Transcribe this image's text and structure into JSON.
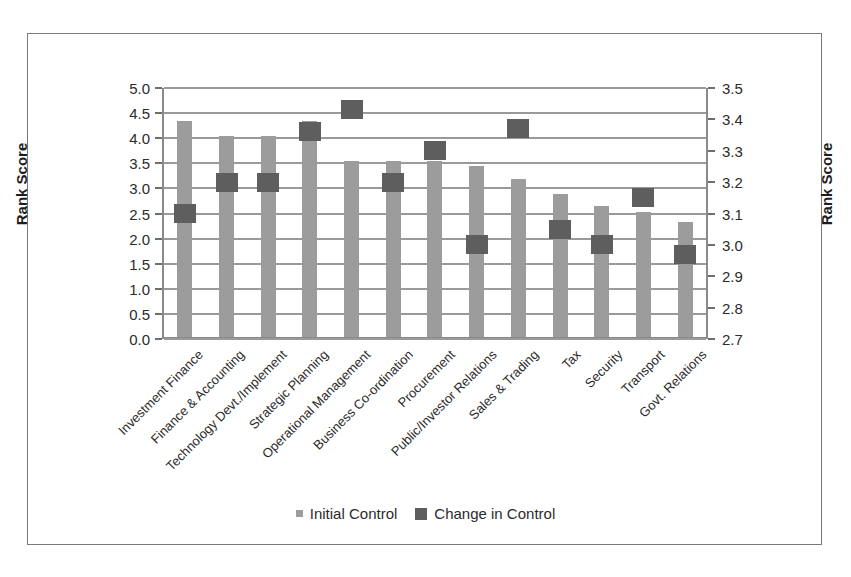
{
  "chart_data": {
    "type": "bar",
    "title": "",
    "categories": [
      "Investment Finance",
      "Finance & Accounting",
      "Technology Devt./Implement",
      "Strategic Planning",
      "Operational Management",
      "Business Co-ordination",
      "Procurement",
      "Public/Investor Relations",
      "Sales & Trading",
      "Tax",
      "Security",
      "Transport",
      "Govt. Relations"
    ],
    "series": [
      {
        "name": "Initial Control",
        "axis": "left",
        "type": "bar",
        "color": "#9c9c9c",
        "values": [
          4.3,
          4.0,
          4.0,
          4.3,
          3.5,
          3.5,
          3.5,
          3.4,
          3.15,
          2.85,
          2.6,
          2.5,
          2.3
        ]
      },
      {
        "name": "Change in Control",
        "axis": "right",
        "type": "marker",
        "color": "#5e5e5e",
        "values": [
          3.1,
          3.2,
          3.2,
          3.36,
          3.43,
          3.2,
          3.3,
          3.0,
          3.37,
          3.05,
          3.0,
          3.15,
          2.97
        ]
      }
    ],
    "xlabel": "",
    "ylabel": "Rank Score",
    "ylabel_secondary": "Rank Score",
    "ylim": [
      0.0,
      5.0
    ],
    "ylim_secondary": [
      2.7,
      3.5
    ],
    "yticks": [
      "0.0",
      "0.5",
      "1.0",
      "1.5",
      "2.0",
      "2.5",
      "3.0",
      "3.5",
      "4.0",
      "4.5",
      "5.0"
    ],
    "yticks_secondary": [
      "2.7",
      "2.8",
      "2.9",
      "3.0",
      "3.1",
      "3.2",
      "3.3",
      "3.4",
      "3.5"
    ],
    "grid": true,
    "legend_position": "bottom"
  },
  "axes": {
    "left_title": "Rank Score",
    "right_title": "Rank Score"
  },
  "legend": {
    "items": [
      {
        "label": "Initial Control",
        "color": "#9c9c9c",
        "marker": "small-square"
      },
      {
        "label": "Change in Control",
        "color": "#5e5e5e",
        "marker": "large-square"
      }
    ]
  }
}
